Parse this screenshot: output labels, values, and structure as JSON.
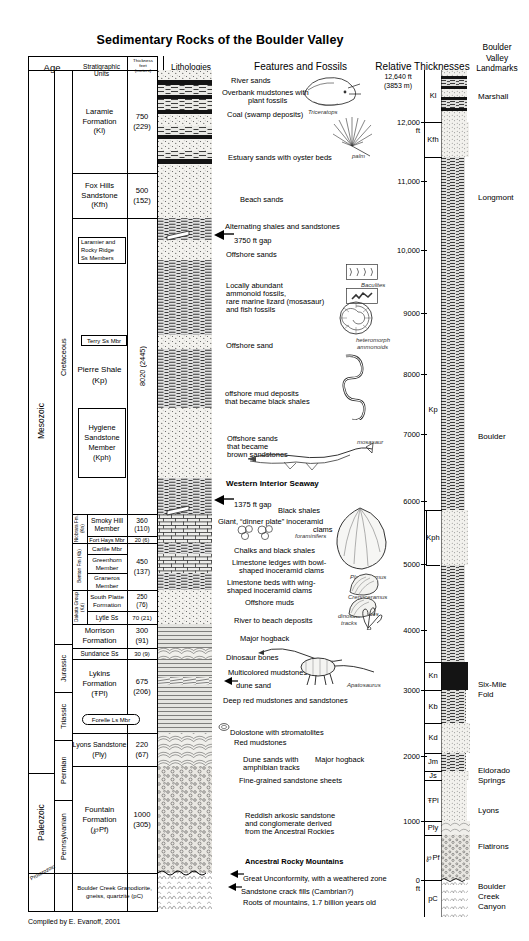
{
  "title": "Sedimentary Rocks of the Boulder Valley",
  "credit": "Compiled by E. Evanoff, 2001",
  "headers": {
    "age": "Age",
    "strat": "Stratigraphic Units",
    "thick1": "Thickness",
    "thick2": "feet",
    "thick3": "(meters)",
    "lith": "Lithologies",
    "features": "Features and Fossils",
    "relthick": "Relative Thicknesses",
    "landmarks1": "Boulder",
    "landmarks2": "Valley",
    "landmarks3": "Landmarks"
  },
  "eras": [
    {
      "label": "Mesozoic"
    },
    {
      "label": "Paleozoic"
    },
    {
      "label": "Proterozoic"
    }
  ],
  "periods": [
    {
      "label": "Cretaceous"
    },
    {
      "label": "Jurassic"
    },
    {
      "label": "Triassic"
    },
    {
      "label": "Permian"
    },
    {
      "label": "Pennsylvanian"
    }
  ],
  "groups": [
    {
      "label": "Niobrara Fm. (Kn)"
    },
    {
      "label": "Benton Fm (Kb)"
    },
    {
      "label": "Dakota Group (Kd)"
    }
  ],
  "units": [
    {
      "name": "Laramie Formation (Kl)",
      "l1": "Laramie",
      "l2": "Formation",
      "l3": "(Kl)",
      "feet": "750",
      "meters": "(229)"
    },
    {
      "name": "Fox Hills Sandstone (Kfh)",
      "l1": "Fox Hills",
      "l2": "Sandstone",
      "l3": "(Kfh)",
      "feet": "500",
      "meters": "(152)"
    },
    {
      "name": "Laramier and Rocky Ridge Ss Members",
      "l1": "Laramier and",
      "l2": "Rocky Ridge",
      "l3": "Ss Members",
      "feet": "",
      "meters": ""
    },
    {
      "name": "Terry Ss Mbr",
      "l1": "Terry Ss Mbr",
      "l2": "",
      "l3": "",
      "feet": "",
      "meters": ""
    },
    {
      "name": "Pierre Shale (Kp)",
      "l1": "Pierre Shale",
      "l2": "(Kp)",
      "l3": "",
      "feet": "8020 (2445)",
      "meters": ""
    },
    {
      "name": "Hygiene Sandstone Member (Kph)",
      "l1": "Hygiene",
      "l2": "Sandstone",
      "l3": "Member",
      "l4": "(Kph)",
      "feet": "",
      "meters": ""
    },
    {
      "name": "Smoky Hill Member",
      "l1": "Smoky Hill",
      "l2": "Member",
      "feet": "360",
      "meters": "(110)"
    },
    {
      "name": "Fort Hays Mbr",
      "l1": "Fort Hays Mbr",
      "feet": "20 (6)",
      "meters": ""
    },
    {
      "name": "Carlile Mbr",
      "l1": "Carlile Mbr",
      "feet": "",
      "meters": ""
    },
    {
      "name": "Greenhorn Member",
      "l1": "Greenhorn",
      "l2": "Member",
      "feet": "450",
      "meters": "(137)"
    },
    {
      "name": "Graneros Member",
      "l1": "Graneros",
      "l2": "Member",
      "feet": "",
      "meters": ""
    },
    {
      "name": "South Platte Formation",
      "l1": "South Platte",
      "l2": "Formation",
      "feet": "250",
      "meters": "(76)"
    },
    {
      "name": "Lytle Ss",
      "l1": "Lytle Ss",
      "feet": "70 (21)",
      "meters": ""
    },
    {
      "name": "Morrison Formation",
      "l1": "Morrison",
      "l2": "Formation",
      "feet": "300",
      "meters": "(91)"
    },
    {
      "name": "Sundance Ss",
      "l1": "Sundance Ss",
      "feet": "30 (9)",
      "meters": ""
    },
    {
      "name": "Lykins Formation",
      "l1": "Lykins",
      "l2": "Formation",
      "l3": "(ŦPl)",
      "feet": "675",
      "meters": "(206)"
    },
    {
      "name": "Forelle Ls Mbr",
      "l1": "Forelle Ls Mbr",
      "feet": "",
      "meters": ""
    },
    {
      "name": "Lyons Sandstone",
      "l1": "Lyons Sandstone",
      "l2": "(Ply)",
      "feet": "220",
      "meters": "(67)"
    },
    {
      "name": "Fountain Formation",
      "l1": "Fountain",
      "l2": "Formation",
      "l3": "(℘Pf)",
      "feet": "1000",
      "meters": "(305)"
    },
    {
      "name": "Boulder Creek Granodiorite",
      "l1": "Boulder Creek Granodiorite,",
      "l2": "gneiss, quartzite (pC)",
      "feet": "",
      "meters": ""
    }
  ],
  "features": [
    {
      "text": "River sands",
      "y": 76,
      "x": 231,
      "align": "left"
    },
    {
      "text": "Overbank mudstones with",
      "y": 88,
      "x": 222,
      "align": "left"
    },
    {
      "text": "plant fossils",
      "y": 96,
      "x": 248,
      "align": "left"
    },
    {
      "text": "Coal (swamp deposits)",
      "y": 110,
      "x": 227,
      "align": "left"
    },
    {
      "text": "Estuary sands with oyster beds",
      "y": 153,
      "x": 228,
      "align": "left"
    },
    {
      "text": "Beach sands",
      "y": 195,
      "x": 240,
      "align": "left"
    },
    {
      "text": "Alternating shales and sandstones",
      "y": 222,
      "x": 225,
      "align": "left"
    },
    {
      "text": "3750 ft gap",
      "y": 236,
      "x": 234,
      "align": "left"
    },
    {
      "text": "Offshore sands",
      "y": 250,
      "x": 226,
      "align": "left"
    },
    {
      "text": "Locally abundant",
      "y": 281,
      "x": 226,
      "align": "left"
    },
    {
      "text": "ammonoid fossils,",
      "y": 289,
      "x": 226,
      "align": "left"
    },
    {
      "text": "rare marine lizard (mosasaur)",
      "y": 297,
      "x": 226,
      "align": "left"
    },
    {
      "text": "and fish fossils",
      "y": 305,
      "x": 226,
      "align": "left"
    },
    {
      "text": "Offshore sand",
      "y": 341,
      "x": 226,
      "align": "left"
    },
    {
      "text": "offshore mud deposits",
      "y": 389,
      "x": 225,
      "align": "left"
    },
    {
      "text": "that became black shales",
      "y": 397,
      "x": 225,
      "align": "left"
    },
    {
      "text": "Offshore sands",
      "y": 434,
      "x": 227,
      "align": "left"
    },
    {
      "text": "that became",
      "y": 442,
      "x": 227,
      "align": "left"
    },
    {
      "text": "brown sandstones",
      "y": 450,
      "x": 227,
      "align": "left"
    },
    {
      "text": "1375 ft gap",
      "y": 500,
      "x": 234,
      "align": "left"
    },
    {
      "text": "Black shales",
      "y": 506,
      "x": 278,
      "align": "left"
    },
    {
      "text": "Giant, “dinner plate” inoceramid",
      "y": 517,
      "x": 218,
      "align": "left"
    },
    {
      "text": "clams",
      "y": 525,
      "x": 313,
      "align": "left"
    },
    {
      "text": "Chalks and black shales",
      "y": 546,
      "x": 234,
      "align": "left"
    },
    {
      "text": "Limestone ledges with bowl-",
      "y": 558,
      "x": 232,
      "align": "left"
    },
    {
      "text": "shaped inoceramid clams",
      "y": 566,
      "x": 239,
      "align": "left"
    },
    {
      "text": "Limestone beds with wing-",
      "y": 578,
      "x": 227,
      "align": "left"
    },
    {
      "text": "shaped inoceramid clams",
      "y": 586,
      "x": 227,
      "align": "left"
    },
    {
      "text": "Offshore muds",
      "y": 598,
      "x": 245,
      "align": "left"
    },
    {
      "text": "River to beach deposits",
      "y": 616,
      "x": 234,
      "align": "left"
    },
    {
      "text": "Major hogback",
      "y": 634,
      "x": 240,
      "align": "left"
    },
    {
      "text": "Dinosaur bones",
      "y": 653,
      "x": 226,
      "align": "left"
    },
    {
      "text": "Multicolored mudstones",
      "y": 668,
      "x": 228,
      "align": "left"
    },
    {
      "text": "dune sand",
      "y": 681,
      "x": 236,
      "align": "left"
    },
    {
      "text": "Deep red mudstones and sandstones",
      "y": 696,
      "x": 223,
      "align": "left"
    },
    {
      "text": "Dolostone with stromatolites",
      "y": 728,
      "x": 230,
      "align": "left"
    },
    {
      "text": "Red mudstones",
      "y": 738,
      "x": 234,
      "align": "left"
    },
    {
      "text": "Dune sands with",
      "y": 755,
      "x": 243,
      "align": "left"
    },
    {
      "text": "amphibian tracks",
      "y": 763,
      "x": 243,
      "align": "left"
    },
    {
      "text": "Major hogback",
      "y": 755,
      "x": 315,
      "align": "left"
    },
    {
      "text": "Fine-grained sandstone sheets",
      "y": 776,
      "x": 239,
      "align": "left"
    },
    {
      "text": "Reddish arkosic sandstone",
      "y": 811,
      "x": 245,
      "align": "left"
    },
    {
      "text": "and conglomerate derived",
      "y": 819,
      "x": 245,
      "align": "left"
    },
    {
      "text": "from the Ancestral Rockies",
      "y": 827,
      "x": 245,
      "align": "left"
    },
    {
      "text": "Ancestral Rocky Mountains",
      "y": 857,
      "x": 245,
      "align": "left",
      "bold": true
    },
    {
      "text": "Great Unconformity, with a weathered zone",
      "y": 874,
      "x": 243,
      "align": "left"
    },
    {
      "text": "Sandstone crack fills (Cambrian?)",
      "y": 887,
      "x": 241,
      "align": "left"
    },
    {
      "text": "Roots of mountains, 1.7 billion years old",
      "y": 898,
      "x": 243,
      "align": "left"
    }
  ],
  "seaway_label": "Western Interior Seaway",
  "fossil_labels": [
    {
      "name": "Triceratops",
      "y": 109,
      "x": 308
    },
    {
      "name": "palm",
      "y": 153,
      "x": 352
    },
    {
      "name": "Baculites",
      "y": 282,
      "x": 361
    },
    {
      "name": "heteromorph",
      "y": 337,
      "x": 356
    },
    {
      "name": "ammonoids",
      "y": 344,
      "x": 357
    },
    {
      "name": "mosasaur",
      "y": 439,
      "x": 357
    },
    {
      "name": "foraminifers",
      "y": 533,
      "x": 295
    },
    {
      "name": "Platyceramus",
      "y": 574,
      "x": 350
    },
    {
      "name": "Crenoceramus",
      "y": 594,
      "x": 348
    },
    {
      "name": "Mytiloides",
      "y": 611,
      "x": 352
    },
    {
      "name": "dinosaur",
      "y": 613,
      "x": 338
    },
    {
      "name": "tracks",
      "y": 620,
      "x": 341
    },
    {
      "name": "Apatosaurus",
      "y": 682,
      "x": 347
    }
  ],
  "scale": {
    "top_label1": "12,640 ft",
    "top_label2": "(3853 m)",
    "ticks": [
      {
        "label": "12,000",
        "sub": "ft",
        "y": 122
      },
      {
        "label": "11,000",
        "sub": "",
        "y": 181
      },
      {
        "label": "10,000",
        "sub": "",
        "y": 250
      },
      {
        "label": "9000",
        "sub": "",
        "y": 313
      },
      {
        "label": "8000",
        "sub": "",
        "y": 374
      },
      {
        "label": "7000",
        "sub": "",
        "y": 434
      },
      {
        "label": "6000",
        "sub": "",
        "y": 501
      },
      {
        "label": "5000",
        "sub": "",
        "y": 564
      },
      {
        "label": "4000",
        "sub": "",
        "y": 630
      },
      {
        "label": "3000",
        "sub": "",
        "y": 690
      },
      {
        "label": "2000",
        "sub": "",
        "y": 756
      },
      {
        "label": "1000",
        "sub": "",
        "y": 821
      },
      {
        "label": "0",
        "sub": "ft",
        "y": 880
      }
    ]
  },
  "rel_units": [
    {
      "code": "Kl",
      "y": 70,
      "h": 52
    },
    {
      "code": "Kfh",
      "y": 122,
      "h": 35
    },
    {
      "code": "Kp",
      "y": 157,
      "h": 505
    },
    {
      "code": "Kph",
      "y": 510,
      "h": 55
    },
    {
      "code": "Kn",
      "y": 662,
      "h": 28
    },
    {
      "code": "Kb",
      "y": 690,
      "h": 33
    },
    {
      "code": "Kd",
      "y": 723,
      "h": 30
    },
    {
      "code": "Jm",
      "y": 753,
      "h": 18
    },
    {
      "code": "Js",
      "y": 771,
      "h": 9
    },
    {
      "code": "ŦPl",
      "y": 780,
      "h": 41
    },
    {
      "code": "Ply",
      "y": 821,
      "h": 14
    },
    {
      "code": "℘Pf",
      "y": 835,
      "h": 45
    },
    {
      "code": "pC",
      "y": 880,
      "h": 37
    }
  ],
  "landmarks": [
    {
      "label": "Marshall",
      "y": 92
    },
    {
      "label": "Longmont",
      "y": 193
    },
    {
      "label": "Boulder",
      "y": 432
    },
    {
      "label": "Six-Mile",
      "y": 680
    },
    {
      "label": "Fold",
      "y": 690
    },
    {
      "label": "Eldorado",
      "y": 766
    },
    {
      "label": "Springs",
      "y": 776
    },
    {
      "label": "Lyons",
      "y": 806
    },
    {
      "label": "Flatirons",
      "y": 842
    },
    {
      "label": "Boulder",
      "y": 882
    },
    {
      "label": "Creek",
      "y": 892
    },
    {
      "label": "Canyon",
      "y": 902
    }
  ]
}
